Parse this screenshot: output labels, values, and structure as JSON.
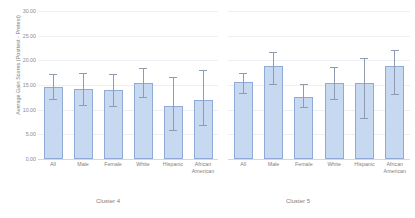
{
  "chart_data": {
    "type": "bar",
    "title": "",
    "subtitle": "",
    "xlabel": "",
    "ylabel": "Average Gain Scores (Posttest - Pretest)",
    "ylim": [
      0,
      30
    ],
    "ytick_labels": [
      "30.00",
      "25.00",
      "20.00",
      "15.00",
      "10.00",
      "5.00",
      "0.00"
    ],
    "ytick_values": [
      30,
      25,
      20,
      15,
      10,
      5,
      0
    ],
    "grid": true,
    "legend": "none",
    "error_bars": "yes",
    "group_labels": [
      "Cluster 4",
      "Cluster 5"
    ],
    "categories": [
      "All",
      "Male",
      "Female",
      "White",
      "Hispanic",
      "African American"
    ],
    "groups": [
      {
        "name": "Cluster 4",
        "values": [
          14.6,
          14.1,
          14.0,
          15.4,
          10.8,
          12.0
        ],
        "err_low": [
          11.9,
          10.7,
          10.6,
          12.4,
          5.6,
          6.6
        ],
        "err_high": [
          17.3,
          17.4,
          17.3,
          18.4,
          16.6,
          18.0
        ]
      },
      {
        "name": "Cluster 5",
        "values": [
          15.6,
          18.8,
          12.6,
          15.5,
          15.4,
          18.9
        ],
        "err_low": [
          13.1,
          15.1,
          10.4,
          12.0,
          8.2,
          13.0
        ],
        "err_high": [
          17.5,
          21.6,
          15.2,
          18.7,
          20.4,
          22.2
        ]
      }
    ],
    "colors": {
      "bar_fill": "#c6d9f0",
      "bar_border": "#8faad4",
      "error_bar": "#8f9bb0",
      "gridline": "#eceff3",
      "axis": "#d3d8de",
      "text": "#808080",
      "background": "#ffffff"
    }
  }
}
